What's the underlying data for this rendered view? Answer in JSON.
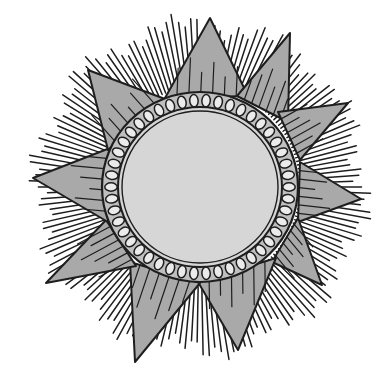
{
  "image": {
    "width": 384,
    "height": 381,
    "subject": "sun illustration",
    "style": "black-and-white pen drawing with gray fills"
  },
  "colors": {
    "background": "#ffffff",
    "ink": "#1e1e1e",
    "triangle_fill": "#a9a9a9",
    "face_fill": "#d6d6d6",
    "bead_fill": "#ebebeb",
    "band_fill": "#bfbfbf"
  },
  "sun": {
    "center": [
      200,
      187
    ],
    "bead_ring": {
      "rx": 98,
      "ry": 95,
      "bead_count": 46
    },
    "face": {
      "rx": 78,
      "ry": 76
    },
    "rays": {
      "count": 170,
      "inner_radius": 100,
      "outer_radius_min": 148,
      "outer_radius_max": 175
    },
    "points": [
      {
        "tip": [
          210,
          18
        ],
        "base_left": [
          165,
          98
        ],
        "base_right": [
          248,
          96
        ]
      },
      {
        "tip": [
          290,
          33
        ],
        "base_left": [
          237,
          96
        ],
        "base_right": [
          288,
          122
        ]
      },
      {
        "tip": [
          348,
          103
        ],
        "base_left": [
          278,
          112
        ],
        "base_right": [
          300,
          160
        ]
      },
      {
        "tip": [
          361,
          199
        ],
        "base_left": [
          300,
          162
        ],
        "base_right": [
          298,
          222
        ]
      },
      {
        "tip": [
          322,
          285
        ],
        "base_left": [
          298,
          218
        ],
        "base_right": [
          272,
          262
        ]
      },
      {
        "tip": [
          238,
          350
        ],
        "base_left": [
          276,
          258
        ],
        "base_right": [
          198,
          282
        ]
      },
      {
        "tip": [
          135,
          362
        ],
        "base_left": [
          200,
          283
        ],
        "base_right": [
          130,
          262
        ]
      },
      {
        "tip": [
          46,
          283
        ],
        "base_left": [
          136,
          266
        ],
        "base_right": [
          106,
          220
        ]
      },
      {
        "tip": [
          33,
          178
        ],
        "base_left": [
          108,
          222
        ],
        "base_right": [
          110,
          148
        ]
      },
      {
        "tip": [
          88,
          70
        ],
        "base_left": [
          108,
          150
        ],
        "base_right": [
          165,
          99
        ]
      }
    ]
  }
}
